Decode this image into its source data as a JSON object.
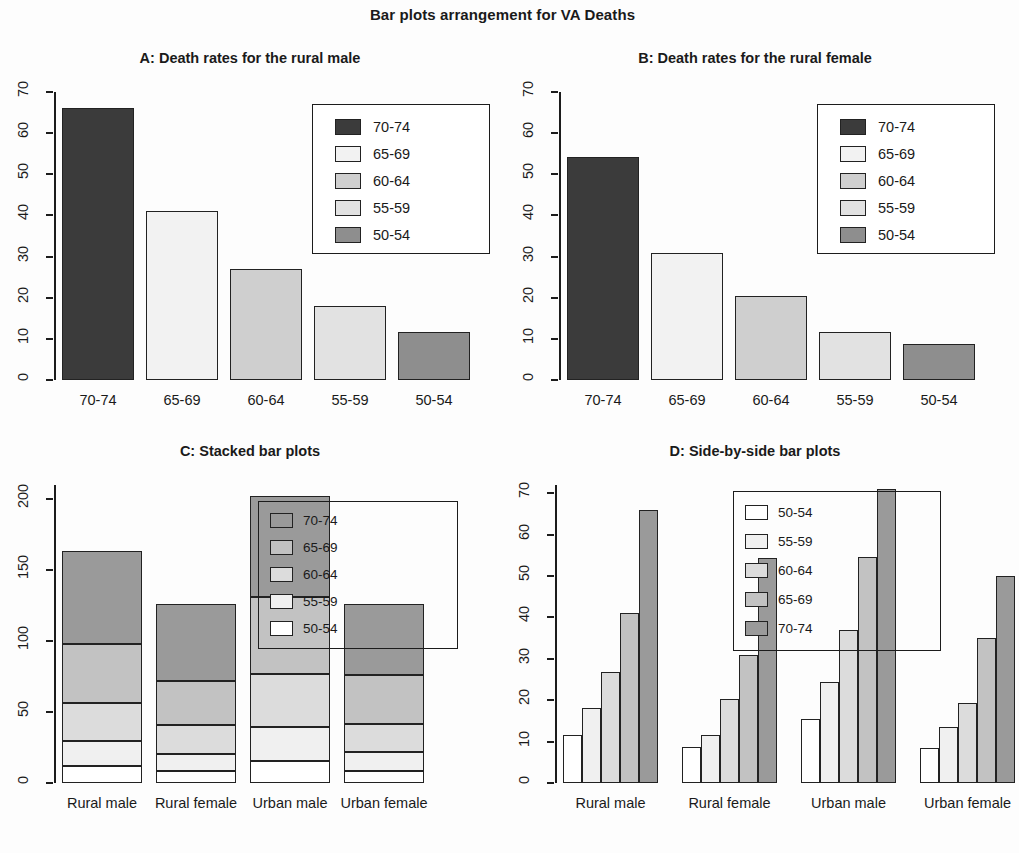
{
  "figure": {
    "main_title": "Bar plots arrangement for VA Deaths",
    "age_groups": [
      "50-54",
      "55-59",
      "60-64",
      "65-69",
      "70-74"
    ],
    "age_groups_desc": [
      "70-74",
      "65-69",
      "60-64",
      "55-59",
      "50-54"
    ],
    "groups": [
      "Rural male",
      "Rural female",
      "Urban male",
      "Urban female"
    ]
  },
  "panels": {
    "a": {
      "title": "A: Death rates for the rural male",
      "y_ticks": [
        "0",
        "10",
        "20",
        "30",
        "40",
        "50",
        "60",
        "70"
      ],
      "x_ticks": [
        "70-74",
        "65-69",
        "60-64",
        "55-59",
        "50-54"
      ],
      "legend": [
        "70-74",
        "65-69",
        "60-64",
        "55-59",
        "50-54"
      ]
    },
    "b": {
      "title": "B: Death rates for the rural female",
      "y_ticks": [
        "0",
        "10",
        "20",
        "30",
        "40",
        "50",
        "60",
        "70"
      ],
      "x_ticks": [
        "70-74",
        "65-69",
        "60-64",
        "55-59",
        "50-54"
      ],
      "legend": [
        "70-74",
        "65-69",
        "60-64",
        "55-59",
        "50-54"
      ]
    },
    "c": {
      "title": "C: Stacked bar plots",
      "y_ticks": [
        "0",
        "50",
        "100",
        "150",
        "200"
      ],
      "x_ticks": [
        "Rural male",
        "Rural female",
        "Urban male",
        "Urban female"
      ],
      "legend": [
        "70-74",
        "65-69",
        "60-64",
        "55-59",
        "50-54"
      ]
    },
    "d": {
      "title": "D: Side-by-side bar plots",
      "y_ticks": [
        "0",
        "10",
        "20",
        "30",
        "40",
        "50",
        "60",
        "70"
      ],
      "x_ticks": [
        "Rural male",
        "Rural female",
        "Urban male",
        "Urban female"
      ],
      "legend": [
        "50-54",
        "55-59",
        "60-64",
        "65-69",
        "70-74"
      ]
    }
  },
  "chart_data": [
    {
      "panel": "A",
      "type": "bar",
      "title": "A: Death rates for the rural male",
      "categories": [
        "70-74",
        "65-69",
        "60-64",
        "55-59",
        "50-54"
      ],
      "values": [
        66.0,
        41.0,
        26.9,
        18.1,
        11.7
      ],
      "xlabel": "",
      "ylabel": "",
      "ylim": [
        0,
        70
      ],
      "yticks": [
        0,
        10,
        20,
        30,
        40,
        50,
        60,
        70
      ],
      "grid": false,
      "legend": {
        "position": "top-right",
        "entries": [
          "70-74",
          "65-69",
          "60-64",
          "55-59",
          "50-54"
        ]
      },
      "colors": [
        "#3b3b3b",
        "#f2f2f2",
        "#cfcfcf",
        "#e2e2e2",
        "#8e8e8e"
      ]
    },
    {
      "panel": "B",
      "type": "bar",
      "title": "B: Death rates for the rural female",
      "categories": [
        "70-74",
        "65-69",
        "60-64",
        "55-59",
        "50-54"
      ],
      "values": [
        54.3,
        30.9,
        20.3,
        11.7,
        8.7
      ],
      "xlabel": "",
      "ylabel": "",
      "ylim": [
        0,
        70
      ],
      "yticks": [
        0,
        10,
        20,
        30,
        40,
        50,
        60,
        70
      ],
      "grid": false,
      "legend": {
        "position": "top-right",
        "entries": [
          "70-74",
          "65-69",
          "60-64",
          "55-59",
          "50-54"
        ]
      },
      "colors": [
        "#3b3b3b",
        "#f2f2f2",
        "#cfcfcf",
        "#e2e2e2",
        "#8e8e8e"
      ]
    },
    {
      "panel": "C",
      "type": "bar",
      "subtype": "stacked",
      "title": "C: Stacked bar plots",
      "categories": [
        "Rural male",
        "Rural female",
        "Urban male",
        "Urban female"
      ],
      "series": [
        {
          "name": "50-54",
          "values": [
            11.7,
            8.7,
            15.4,
            8.4
          ]
        },
        {
          "name": "55-59",
          "values": [
            18.1,
            11.7,
            24.3,
            13.6
          ]
        },
        {
          "name": "60-64",
          "values": [
            26.9,
            20.3,
            37.0,
            19.3
          ]
        },
        {
          "name": "65-69",
          "values": [
            41.0,
            30.9,
            54.6,
            35.1
          ]
        },
        {
          "name": "70-74",
          "values": [
            66.0,
            54.3,
            71.1,
            50.0
          ]
        }
      ],
      "totals": [
        163.7,
        125.9,
        202.4,
        126.4
      ],
      "xlabel": "",
      "ylabel": "",
      "ylim": [
        0,
        210
      ],
      "yticks": [
        0,
        50,
        100,
        150,
        200
      ],
      "grid": false,
      "legend": {
        "position": "top-right-overlapping",
        "entries": [
          "70-74",
          "65-69",
          "60-64",
          "55-59",
          "50-54"
        ]
      },
      "colors": [
        "#ffffff",
        "#f0f0f0",
        "#dcdcdc",
        "#c2c2c2",
        "#9a9a9a"
      ]
    },
    {
      "panel": "D",
      "type": "bar",
      "subtype": "grouped",
      "title": "D: Side-by-side bar plots",
      "categories": [
        "Rural male",
        "Rural female",
        "Urban male",
        "Urban female"
      ],
      "series": [
        {
          "name": "50-54",
          "values": [
            11.7,
            8.7,
            15.4,
            8.4
          ]
        },
        {
          "name": "55-59",
          "values": [
            18.1,
            11.7,
            24.3,
            13.6
          ]
        },
        {
          "name": "60-64",
          "values": [
            26.9,
            20.3,
            37.0,
            19.3
          ]
        },
        {
          "name": "65-69",
          "values": [
            41.0,
            30.9,
            54.6,
            35.1
          ]
        },
        {
          "name": "70-74",
          "values": [
            66.0,
            54.3,
            71.1,
            50.0
          ]
        }
      ],
      "xlabel": "",
      "ylabel": "",
      "ylim": [
        0,
        72
      ],
      "yticks": [
        0,
        10,
        20,
        30,
        40,
        50,
        60,
        70
      ],
      "grid": false,
      "legend": {
        "position": "top-right-overlapping",
        "entries": [
          "50-54",
          "55-59",
          "60-64",
          "65-69",
          "70-74"
        ]
      },
      "colors": [
        "#ffffff",
        "#f0f0f0",
        "#dcdcdc",
        "#c2c2c2",
        "#9a9a9a"
      ]
    }
  ]
}
